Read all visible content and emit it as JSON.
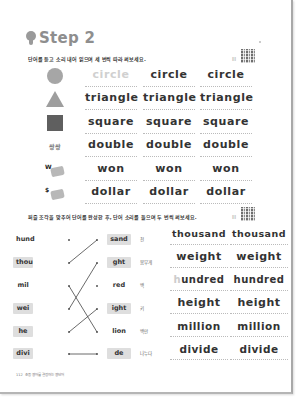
{
  "header": {
    "title": "Step 2",
    "icon": "lightbulb-icon"
  },
  "section1": {
    "instruction": "단어를 듣고 소리 내어 읽으며 세 번씩 따라 써보세요.",
    "qr_label": "|||",
    "rows": [
      {
        "picture": "circle-shape",
        "picture_text": "",
        "words": [
          "circle",
          "circle",
          "circle"
        ],
        "first_is_trace": true
      },
      {
        "picture": "triangle-shape",
        "picture_text": "",
        "words": [
          "triangle",
          "triangle",
          "triangle"
        ],
        "first_is_trace": false
      },
      {
        "picture": "square-shape",
        "picture_text": "",
        "words": [
          "square",
          "square",
          "square"
        ],
        "first_is_trace": false
      },
      {
        "picture": "double-text",
        "picture_text": "쌍쌍",
        "words": [
          "double",
          "double",
          "double"
        ],
        "first_is_trace": false
      },
      {
        "picture": "won-money",
        "picture_text": "W",
        "words": [
          "won",
          "won",
          "won"
        ],
        "first_is_trace": false
      },
      {
        "picture": "dollar-money",
        "picture_text": "$",
        "words": [
          "dollar",
          "dollar",
          "dollar"
        ],
        "first_is_trace": false
      }
    ]
  },
  "section2": {
    "instruction": "퍼즐 조각을 맞추어 단어를 완성한 후, 단어 소리를 들으며 두 번씩 써보세요.",
    "qr_label": "|||",
    "left_pieces": [
      "hund",
      "thou",
      "mil",
      "wei",
      "he",
      "divi"
    ],
    "right_pieces": [
      "sand",
      "ght",
      "red",
      "ight",
      "lion",
      "de"
    ],
    "meanings": [
      "천",
      "몸무게",
      "백",
      "키",
      "백만",
      "나누다"
    ],
    "connections": [
      {
        "from": "thou",
        "to": "sand"
      },
      {
        "from": "mil",
        "to": "lion"
      },
      {
        "from": "wei",
        "to": "ght"
      },
      {
        "from": "he",
        "to": "ight"
      },
      {
        "from": "divi",
        "to": "de"
      }
    ],
    "answers": [
      [
        "thousand",
        "thousand"
      ],
      [
        "weight",
        "weight"
      ],
      [
        "hundred",
        "hundred"
      ],
      [
        "height",
        "height"
      ],
      [
        "million",
        "million"
      ],
      [
        "divide",
        "divide"
      ]
    ],
    "answer3_first_char_faint": "h",
    "answer3_first_rest": "undred"
  },
  "footer": {
    "page_number": "112",
    "text": "초등 영어를 결정하는 영단어"
  },
  "colors": {
    "title_gray": "#8e8e8e",
    "trace_text": "#d0d0d0",
    "piece_shade": "#dedede"
  }
}
